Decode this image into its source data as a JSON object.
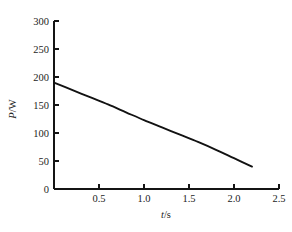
{
  "chart_data": {
    "type": "line",
    "title": "",
    "subtitle": "",
    "xlabel": "t/s",
    "ylabel": "P/W",
    "xlabel_symbol": "t",
    "xlabel_unit": "/s",
    "ylabel_symbol": "P",
    "ylabel_unit": "/W",
    "xlim": [
      0,
      2.5
    ],
    "ylim": [
      0,
      300
    ],
    "grid": false,
    "legend": false,
    "legend_position": "none",
    "x_ticks": [
      0,
      0.5,
      1.0,
      1.5,
      2.0,
      2.5
    ],
    "x_tick_labels": [
      "",
      "0.5",
      "1.0",
      "1.5",
      "2.0",
      "2.5"
    ],
    "y_ticks": [
      0,
      50,
      100,
      150,
      200,
      250,
      300
    ],
    "y_tick_labels": [
      "0",
      "50",
      "100",
      "150",
      "200",
      "250",
      "300"
    ],
    "tick_direction": "in",
    "series": [
      {
        "name": "power",
        "color": "#121212",
        "x": [
          0.0,
          0.2,
          0.4,
          0.6,
          0.8,
          1.0,
          1.2,
          1.4,
          1.6,
          1.8,
          2.0,
          2.2
        ],
        "y": [
          190,
          177,
          164,
          151,
          137,
          123,
          110,
          97,
          84,
          70,
          55,
          40
        ]
      }
    ],
    "annotations": [],
    "colors": {
      "background": "#ffffff",
      "axis": "#141414",
      "line": "#121212",
      "text": "#1d1d1d"
    }
  },
  "figure": {
    "width": 292,
    "height": 232,
    "plot_left_px": 54,
    "plot_right_px": 279,
    "plot_top_px": 21,
    "plot_bottom_px": 189
  }
}
